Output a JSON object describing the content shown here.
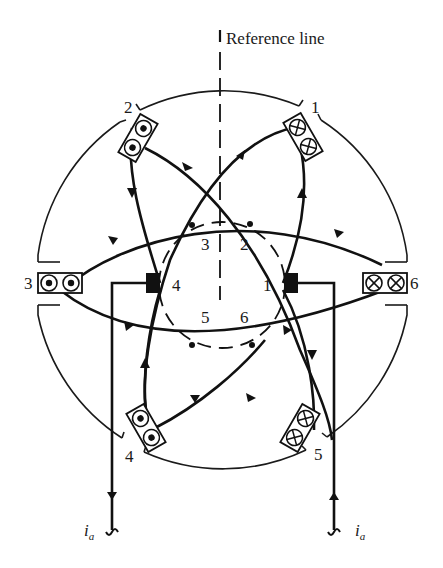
{
  "diagram": {
    "title": "Reference line",
    "reference_line_label": "Reference line",
    "slot_labels": {
      "s1": "1",
      "s2": "2",
      "s3": "3",
      "s4": "4",
      "s5": "5",
      "s6": "6"
    },
    "inner_labels": {
      "c1": "1",
      "c2": "2",
      "c3": "3",
      "c4": "4",
      "c5": "5",
      "c6": "6"
    },
    "current_labels": {
      "left": {
        "main": "i",
        "sub": "a"
      },
      "right": {
        "main": "i",
        "sub": "a"
      }
    },
    "conductor_symbols": {
      "dot": "current out of page (dot)",
      "cross": "current into page (cross)"
    },
    "slots": [
      {
        "id": "1",
        "symbol": "cross",
        "count": 2
      },
      {
        "id": "2",
        "symbol": "dot",
        "count": 2
      },
      {
        "id": "3",
        "symbol": "dot",
        "count": 2
      },
      {
        "id": "4",
        "symbol": "dot",
        "count": 2
      },
      {
        "id": "5",
        "symbol": "cross",
        "count": 2
      },
      {
        "id": "6",
        "symbol": "cross",
        "count": 2
      }
    ],
    "colors": {
      "ink": "#111111",
      "background": "#ffffff"
    }
  }
}
